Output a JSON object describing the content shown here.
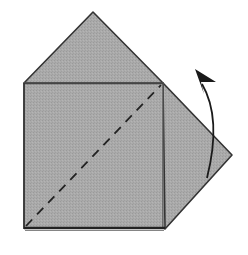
{
  "diagram": {
    "type": "origami-fold-step",
    "colors": {
      "paper": "#a9a9a9",
      "paper_shade": "#9e9e9e",
      "edge": "#333333",
      "fold_line": "#222222",
      "arrow": "#1a1a1a",
      "background": "#ffffff"
    },
    "shapes": {
      "top_triangle": [
        [
          24,
          83
        ],
        [
          93,
          12
        ],
        [
          163,
          83
        ]
      ],
      "right_flap": [
        [
          163,
          83
        ],
        [
          232,
          155
        ],
        [
          163,
          228
        ]
      ],
      "square": [
        [
          24,
          83
        ],
        [
          163,
          83
        ],
        [
          163,
          228
        ],
        [
          24,
          228
        ]
      ],
      "valley_fold_line": [
        [
          26,
          226
        ],
        [
          161,
          85
        ]
      ],
      "fold_arrow": {
        "start": [
          207,
          178
        ],
        "control": [
          222,
          115
        ],
        "end": [
          200,
          78
        ],
        "head_tip": [
          196,
          69
        ]
      }
    }
  }
}
